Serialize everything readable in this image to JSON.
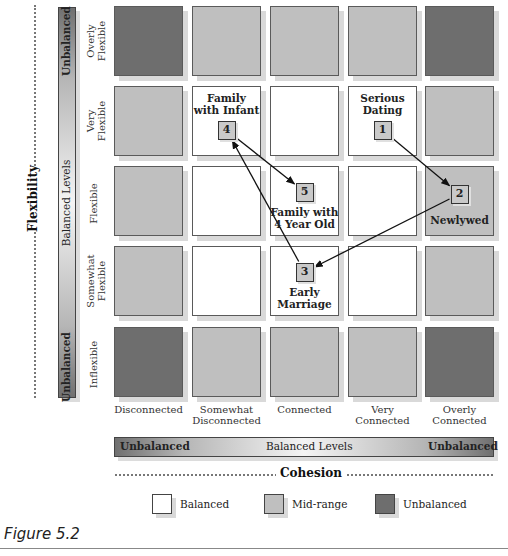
{
  "figure_title": "Figure 5.2",
  "flexibility_axis": {
    "title": "Flexibility",
    "bar": {
      "top_label": "Unbalanced",
      "middle_label": "Balanced Levels",
      "bottom_label": "Unbalanced"
    },
    "levels": [
      "Overly Flexible",
      "Very Flexible",
      "Flexible",
      "Somewhat Flexible",
      "Inflexible"
    ],
    "level_lines": [
      [
        "Overly",
        "Flexible"
      ],
      [
        "Very",
        "Flexible"
      ],
      [
        "Flexible"
      ],
      [
        "Somewhat",
        "Flexible"
      ],
      [
        "Inflexible"
      ]
    ]
  },
  "cohesion_axis": {
    "title": "Cohesion",
    "bar": {
      "left_label": "Unbalanced",
      "middle_label": "Balanced Levels",
      "right_label": "Unbalanced"
    },
    "levels": [
      "Disconnected",
      "Somewhat Disconnected",
      "Connected",
      "Very Connected",
      "Overly Connected"
    ],
    "level_lines": [
      [
        "Disconnected"
      ],
      [
        "Somewhat",
        "Disconnected"
      ],
      [
        "Connected"
      ],
      [
        "Very",
        "Connected"
      ],
      [
        "Overly",
        "Connected"
      ]
    ]
  },
  "grid": [
    [
      "unbalanced",
      "mid-range",
      "mid-range",
      "mid-range",
      "unbalanced"
    ],
    [
      "mid-range",
      "balanced",
      "balanced",
      "balanced",
      "mid-range"
    ],
    [
      "mid-range",
      "balanced",
      "balanced",
      "balanced",
      "mid-range"
    ],
    [
      "mid-range",
      "balanced",
      "balanced",
      "balanced",
      "mid-range"
    ],
    [
      "unbalanced",
      "mid-range",
      "mid-range",
      "mid-range",
      "unbalanced"
    ]
  ],
  "stages": [
    {
      "number": "1",
      "label_lines": [
        "Serious",
        "Dating"
      ],
      "flexibility": "Very Flexible",
      "cohesion": "Very Connected"
    },
    {
      "number": "2",
      "label_lines": [
        "Newlywed"
      ],
      "flexibility": "Flexible",
      "cohesion": "Overly Connected"
    },
    {
      "number": "3",
      "label_lines": [
        "Early",
        "Marriage"
      ],
      "flexibility": "Somewhat Flexible",
      "cohesion": "Connected"
    },
    {
      "number": "4",
      "label_lines": [
        "Family",
        "with Infant"
      ],
      "flexibility": "Very Flexible",
      "cohesion": "Somewhat Disconnected"
    },
    {
      "number": "5",
      "label_lines": [
        "Family with",
        "4 Year Old"
      ],
      "flexibility": "Flexible",
      "cohesion": "Connected"
    }
  ],
  "transitions": [
    [
      "1",
      "2"
    ],
    [
      "2",
      "3"
    ],
    [
      "3",
      "4"
    ],
    [
      "4",
      "5"
    ]
  ],
  "legend": [
    {
      "key": "balanced",
      "label": "Balanced",
      "color": "#ffffff"
    },
    {
      "key": "mid-range",
      "label": "Mid-range",
      "color": "#bfbfbf"
    },
    {
      "key": "unbalanced",
      "label": "Unbalanced",
      "color": "#6e6e6e"
    }
  ]
}
